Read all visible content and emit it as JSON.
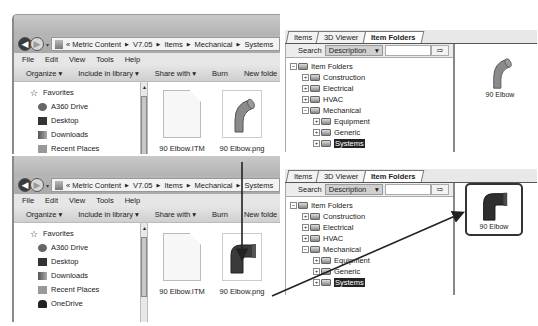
{
  "explorer_windows": [
    {
      "id": "top",
      "breadcrumb": [
        "Metric Content",
        "V7.05",
        "Items",
        "Mechanical",
        "Systems"
      ],
      "breadcrumb_prefix": "«",
      "menu": [
        "File",
        "Edit",
        "View",
        "Tools",
        "Help"
      ],
      "commands": [
        "Organize ▾",
        "Include in library ▾",
        "Share with ▾",
        "Burn",
        "New folde"
      ],
      "nav": {
        "favorites": "Favorites",
        "items": [
          "A360 Drive",
          "Desktop",
          "Downloads",
          "Recent Places",
          "OneDrive"
        ]
      },
      "files": [
        {
          "name": "90 Elbow.ITM",
          "type": "itm"
        },
        {
          "name": "90 Elbow.png",
          "type": "png-light"
        }
      ]
    },
    {
      "id": "bottom",
      "breadcrumb": [
        "Metric Content",
        "V7.05",
        "Items",
        "Mechanical",
        "Systems"
      ],
      "breadcrumb_prefix": "«",
      "menu": [
        "File",
        "Edit",
        "View",
        "Tools",
        "Help"
      ],
      "commands": [
        "Organize ▾",
        "Include in library ▾",
        "Share with ▾",
        "Burn",
        "New folde"
      ],
      "nav": {
        "favorites": "Favorites",
        "items": [
          "A360 Drive",
          "Desktop",
          "Downloads",
          "Recent Places",
          "OneDrive"
        ]
      },
      "files": [
        {
          "name": "90 Elbow.ITM",
          "type": "itm"
        },
        {
          "name": "90 Elbow.png",
          "type": "png-dark"
        }
      ]
    }
  ],
  "fab_panels": [
    {
      "id": "top",
      "tabs": [
        "Items",
        "3D Viewer",
        "Item Folders"
      ],
      "active_tab": "Item Folders",
      "search_label": "Search",
      "search_field": "Description",
      "search_value": "",
      "tree": {
        "root": "Item Folders",
        "children": [
          "Construction",
          "Electrical",
          "HVAC",
          "Mechanical"
        ],
        "mechanical_children": [
          "Equipment",
          "Generic",
          "Systems"
        ],
        "selected": "Systems"
      },
      "preview_item": "90 Elbow"
    },
    {
      "id": "bottom",
      "tabs": [
        "Items",
        "3D Viewer",
        "Item Folders"
      ],
      "active_tab": "Item Folders",
      "search_label": "Search",
      "search_field": "Description",
      "search_value": "",
      "tree": {
        "root": "Item Folders",
        "children": [
          "Construction",
          "Electrical",
          "HVAC",
          "Mechanical"
        ],
        "mechanical_children": [
          "Equipment",
          "Generic",
          "Systems"
        ],
        "selected": "Systems"
      },
      "preview_item": "90 Elbow"
    }
  ],
  "icons": {
    "back": "◀",
    "forward": "▶",
    "dropdown": "▾",
    "breadcrumb_sep": "▶",
    "go_arrow": "⇨",
    "expand": "+",
    "collapse": "−",
    "star": "☆"
  }
}
